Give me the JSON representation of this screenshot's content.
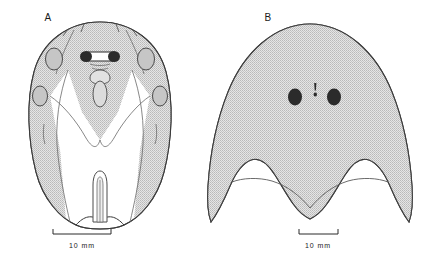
{
  "figure": {
    "type": "scientific-line-drawing",
    "background_color": "#ffffff",
    "panels": [
      {
        "id": "A",
        "label": "A",
        "label_x": 48,
        "label_y": 21,
        "description": "dorsal carapace outline with stippled prosoma, paired eyes, lateral ocelli spots and median telson",
        "fill_color": "#d4d4d4",
        "stroke_color": "#3a3a3a",
        "eye_color": "#2b2b2b",
        "scale_bar": {
          "label": "10 mm",
          "label_x": 82,
          "label_y": 248,
          "x1": 53,
          "x2": 111,
          "y": 234,
          "tick_height": 5
        }
      },
      {
        "id": "B",
        "label": "B",
        "label_x": 268,
        "label_y": 21,
        "description": "dome shaped stippled shield with two dark eyes, median ocellus and scalloped posterior margin with lateral horns",
        "fill_color": "#d4d4d4",
        "stroke_color": "#3a3a3a",
        "eye_color": "#2b2b2b",
        "scale_bar": {
          "label": "10 mm",
          "label_x": 318,
          "label_y": 248,
          "x1": 299,
          "x2": 338,
          "y": 234,
          "tick_height": 5
        }
      }
    ],
    "colors": {
      "stipple_fill": "#d4d4d4",
      "outline": "#3a3a3a",
      "eye_dark": "#2b2b2b",
      "white_fill": "#ffffff",
      "text": "#1a1a1a"
    }
  }
}
